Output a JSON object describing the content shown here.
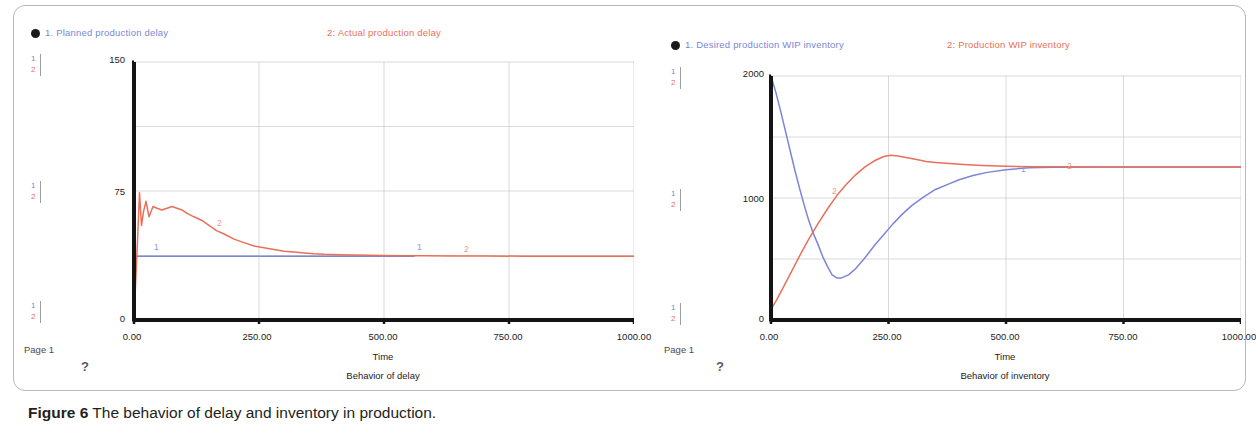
{
  "caption": {
    "label": "Figure 6",
    "text": " The behavior of delay and inventory in production."
  },
  "colors": {
    "series1": "#7b86d6",
    "series2": "#e8705a",
    "axis": "#141414",
    "grid": "#c9c9c9",
    "frame": "#b9b9b9"
  },
  "charts": [
    {
      "id": "delay",
      "page_label": "Page 1",
      "help_glyph": "?",
      "legend": [
        {
          "marker": "1",
          "label": "1. Planned production  delay"
        },
        {
          "marker": "2",
          "label": "2: Actual production  delay"
        }
      ],
      "scale_markers": [
        {
          "s1": "1",
          "s2": "2"
        },
        {
          "s1": "1",
          "s2": "2"
        },
        {
          "s1": "1",
          "s2": "2"
        }
      ],
      "curve_tags": [
        {
          "text": "1"
        },
        {
          "text": "2"
        },
        {
          "text": "1"
        },
        {
          "text": "2"
        }
      ],
      "chart_data": {
        "type": "line",
        "title": "Behavior of delay",
        "xlabel": "Time",
        "ylabel": "",
        "xlim": [
          0,
          1000
        ],
        "ylim": [
          0,
          150
        ],
        "xticks": [
          0,
          250,
          500,
          750,
          1000
        ],
        "xticklabels": [
          "0.00",
          "250.00",
          "500.00",
          "750.00",
          "1000.00"
        ],
        "yticks": [
          0,
          75,
          150
        ],
        "yticklabels": [
          "0",
          "75",
          "150"
        ],
        "yminorticks": [
          37.5,
          112.5
        ],
        "grid": true,
        "legend_position": "top",
        "series": [
          {
            "name": "1. Planned production  delay",
            "color": "#7b86d6",
            "x": [
              0,
              4,
              10,
              60,
              150,
              300,
              450,
              560
            ],
            "values": [
              37,
              37,
              37,
              37,
              37,
              37,
              37,
              37
            ]
          },
          {
            "name": "2: Actual production  delay",
            "color": "#e8705a",
            "x": [
              0,
              3,
              7,
              11,
              15,
              19,
              24,
              30,
              38,
              46,
              56,
              66,
              76,
              86,
              96,
              106,
              120,
              135,
              150,
              165,
              180,
              200,
              220,
              240,
              260,
              280,
              300,
              320,
              340,
              360,
              380,
              410,
              440,
              470,
              500,
              540,
              580,
              640,
              700,
              780,
              860,
              940,
              1000
            ],
            "values": [
              0,
              20,
              46,
              74,
              55,
              63,
              69,
              60,
              66,
              65,
              64,
              65,
              66,
              65,
              64,
              62,
              60,
              58,
              55,
              52,
              50,
              47,
              45,
              43,
              42,
              41,
              40,
              39.5,
              39,
              38.5,
              38.2,
              38,
              37.8,
              37.6,
              37.5,
              37.4,
              37.3,
              37.2,
              37.2,
              37.1,
              37.1,
              37,
              37
            ]
          }
        ]
      }
    },
    {
      "id": "inventory",
      "page_label": "Page 1",
      "help_glyph": "?",
      "legend": [
        {
          "marker": "1",
          "label": "1. Desired production  WIP inventory"
        },
        {
          "marker": "2",
          "label": "2: Production WIP inventory"
        }
      ],
      "scale_markers": [
        {
          "s1": "1",
          "s2": "2"
        },
        {
          "s1": "1",
          "s2": "2"
        },
        {
          "s1": "1",
          "s2": "2"
        }
      ],
      "curve_tags": [
        {
          "text": "2"
        },
        {
          "text": "1"
        },
        {
          "text": "2"
        }
      ],
      "chart_data": {
        "type": "line",
        "title": "Behavior of inventory",
        "xlabel": "Time",
        "ylabel": "",
        "xlim": [
          0,
          1000
        ],
        "ylim": [
          0,
          2000
        ],
        "xticks": [
          0,
          250,
          500,
          750,
          1000
        ],
        "xticklabels": [
          "0.00",
          "250.00",
          "500.00",
          "750.00",
          "1000.00"
        ],
        "yticks": [
          0,
          1000,
          2000
        ],
        "yticklabels": [
          "0",
          "1000",
          "2000"
        ],
        "yminorticks": [
          500,
          1500
        ],
        "grid": true,
        "legend_position": "top",
        "series": [
          {
            "name": "1. Desired production  WIP inventory",
            "color": "#7b86d6",
            "x": [
              0,
              10,
              20,
              30,
              40,
              50,
              60,
              70,
              80,
              90,
              100,
              110,
              120,
              130,
              140,
              150,
              165,
              180,
              200,
              220,
              240,
              260,
              280,
              300,
              325,
              350,
              375,
              400,
              430,
              460,
              500,
              550,
              600,
              700,
              800,
              900,
              1000
            ],
            "values": [
              2000,
              1870,
              1720,
              1560,
              1400,
              1240,
              1090,
              950,
              820,
              710,
              620,
              520,
              440,
              370,
              345,
              345,
              370,
              420,
              510,
              610,
              700,
              790,
              870,
              940,
              1010,
              1070,
              1110,
              1150,
              1185,
              1210,
              1232,
              1248,
              1252,
              1255,
              1255,
              1255,
              1255
            ]
          },
          {
            "name": "2: Production WIP inventory",
            "color": "#e8705a",
            "x": [
              0,
              10,
              25,
              40,
              60,
              80,
              100,
              120,
              140,
              160,
              180,
              200,
              220,
              240,
              255,
              270,
              290,
              310,
              330,
              350,
              380,
              410,
              450,
              500,
              560,
              620,
              700,
              800,
              900,
              1000
            ],
            "values": [
              90,
              150,
              260,
              370,
              520,
              660,
              790,
              910,
              1020,
              1110,
              1190,
              1255,
              1305,
              1340,
              1350,
              1345,
              1330,
              1315,
              1300,
              1292,
              1282,
              1274,
              1266,
              1260,
              1257,
              1256,
              1255,
              1255,
              1255,
              1255
            ]
          }
        ]
      }
    }
  ]
}
